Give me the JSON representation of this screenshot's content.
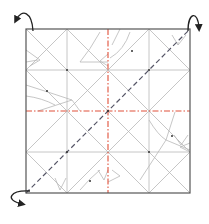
{
  "diagram": {
    "type": "origami-crease-pattern",
    "square": {
      "x": 26,
      "y": 29,
      "size": 164
    },
    "colors": {
      "border": "#555555",
      "crease": "#b0b0b0",
      "mountain": "#e0503a",
      "valley": "#555566",
      "arrow": "#222222"
    },
    "grid_divisions": 4,
    "mountain_folds": [
      "vertical-center",
      "horizontal-center"
    ],
    "valley_folds": [
      "diagonal-bottom-left-to-top-right"
    ],
    "arrows": [
      {
        "position": "top-left",
        "meaning": "fold-behind"
      },
      {
        "position": "top-right",
        "meaning": "fold-behind"
      },
      {
        "position": "bottom-left",
        "meaning": "fold-behind"
      }
    ]
  }
}
